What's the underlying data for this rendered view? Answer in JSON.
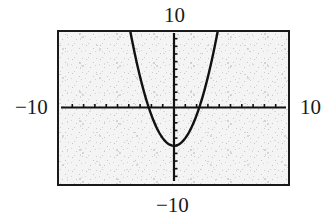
{
  "chart_data": {
    "type": "line",
    "title": "",
    "function": "y = x^2 - 5",
    "xlabel": "",
    "ylabel": "",
    "xlim": [
      -10,
      10
    ],
    "ylim": [
      -10,
      10
    ],
    "xscale_ticks": 1,
    "yscale_ticks": 1,
    "grid": false,
    "legend": null,
    "tick_labels": {
      "xmin": "−10",
      "xmax": "10",
      "ymin": "−10",
      "ymax": "10"
    },
    "series": [
      {
        "name": "y = x^2 - 5",
        "x": [
          -3.87,
          -3.5,
          -3,
          -2.5,
          -2.24,
          -2,
          -1.5,
          -1,
          -0.5,
          0,
          0.5,
          1,
          1.5,
          2,
          2.24,
          2.5,
          3,
          3.5,
          3.87
        ],
        "y": [
          10,
          7.25,
          4,
          1.25,
          0,
          -1,
          -2.75,
          -4,
          -4.75,
          -5,
          -4.75,
          -4,
          -2.75,
          -1,
          0,
          1.25,
          4,
          7.25,
          10
        ]
      }
    ],
    "annotations": {
      "vertex": [
        0,
        -5
      ],
      "x_intercepts": [
        -2.24,
        2.24
      ]
    }
  },
  "style": {
    "background": "#ffffff",
    "plot_background": "#f2f2f2",
    "stroke": "#111111",
    "speckle": "#b8b8b8"
  }
}
